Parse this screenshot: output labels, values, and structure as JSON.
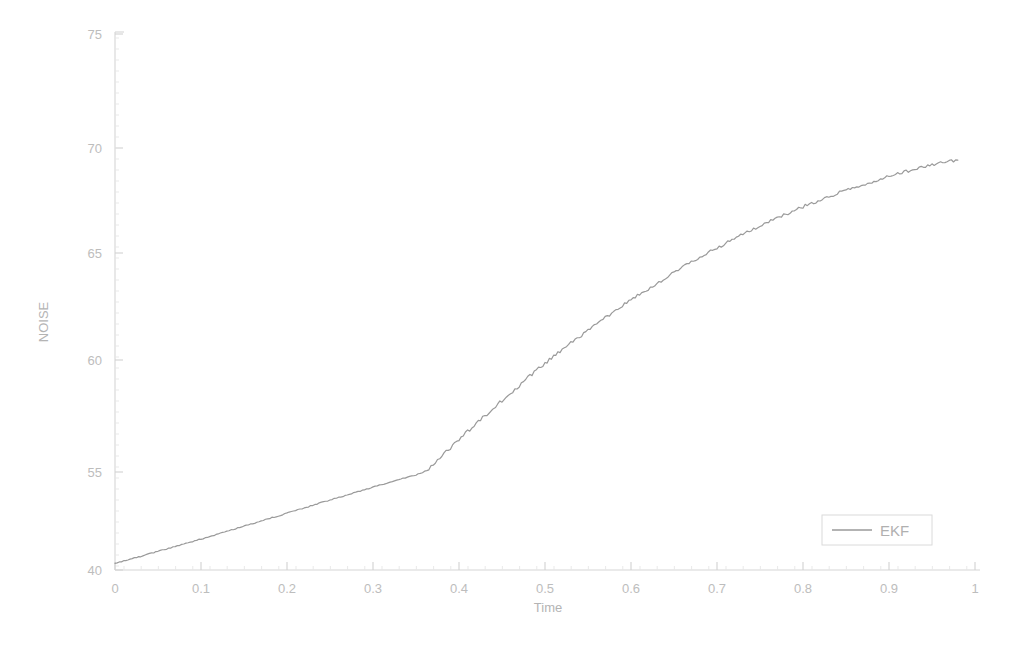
{
  "chart_data": {
    "type": "line",
    "title": "",
    "xlabel": "Time",
    "ylabel": "NOISE",
    "xlim": [
      0,
      1
    ],
    "ylim": [
      40,
      75
    ],
    "xticks": [
      "0",
      "0.1",
      "0.2",
      "0.3",
      "0.4",
      "0.5",
      "0.6",
      "0.7",
      "0.8",
      "0.9",
      "1"
    ],
    "xtick_values": [
      0,
      0.1,
      0.2,
      0.3,
      0.4,
      0.5,
      0.6,
      0.7,
      0.8,
      0.9,
      1
    ],
    "yticks": [
      "40",
      "55",
      "60",
      "65",
      "70",
      "75"
    ],
    "ytick_values": [
      40,
      55,
      60,
      65,
      70,
      75
    ],
    "grid": false,
    "legend": {
      "position": "lower-right",
      "entries": [
        "EKF"
      ]
    },
    "line_color": "#9a9a9a",
    "series": [
      {
        "name": "EKF",
        "color": "#9a9a9a",
        "x": [
          0.0,
          0.01,
          0.02,
          0.03,
          0.04,
          0.05,
          0.06,
          0.07,
          0.08,
          0.09,
          0.1,
          0.11,
          0.12,
          0.13,
          0.14,
          0.15,
          0.16,
          0.17,
          0.18,
          0.19,
          0.2,
          0.21,
          0.22,
          0.23,
          0.24,
          0.25,
          0.26,
          0.27,
          0.28,
          0.29,
          0.3,
          0.31,
          0.32,
          0.33,
          0.34,
          0.35,
          0.36,
          0.37,
          0.38,
          0.39,
          0.4,
          0.41,
          0.42,
          0.43,
          0.44,
          0.45,
          0.46,
          0.47,
          0.48,
          0.49,
          0.5,
          0.51,
          0.52,
          0.53,
          0.54,
          0.55,
          0.56,
          0.57,
          0.58,
          0.59,
          0.6,
          0.61,
          0.62,
          0.63,
          0.64,
          0.65,
          0.66,
          0.67,
          0.68,
          0.69,
          0.7,
          0.71,
          0.72,
          0.73,
          0.74,
          0.75,
          0.76,
          0.77,
          0.78,
          0.79,
          0.8,
          0.81,
          0.82,
          0.83,
          0.84,
          0.85,
          0.86,
          0.87,
          0.88,
          0.89,
          0.9,
          0.91,
          0.92,
          0.93,
          0.94,
          0.95,
          0.96,
          0.97,
          0.98
        ],
        "y": [
          41.0,
          41.35,
          41.72,
          42.1,
          42.48,
          42.85,
          43.22,
          43.6,
          43.98,
          44.36,
          44.74,
          45.12,
          45.52,
          45.92,
          46.32,
          46.7,
          47.1,
          47.5,
          47.92,
          48.3,
          48.7,
          49.1,
          49.5,
          49.92,
          50.32,
          50.7,
          51.1,
          51.48,
          51.88,
          52.28,
          52.68,
          53.05,
          53.44,
          53.82,
          54.2,
          54.58,
          54.96,
          55.34,
          55.72,
          56.08,
          56.44,
          56.8,
          57.15,
          57.5,
          57.84,
          58.18,
          58.52,
          58.86,
          59.2,
          59.52,
          59.84,
          60.16,
          60.48,
          60.78,
          61.08,
          61.38,
          61.66,
          61.96,
          62.24,
          62.52,
          62.8,
          63.06,
          63.32,
          63.58,
          63.84,
          64.08,
          64.32,
          64.56,
          64.8,
          65.02,
          65.24,
          65.46,
          65.68,
          65.88,
          66.08,
          66.28,
          66.48,
          66.66,
          66.84,
          67.02,
          67.2,
          67.36,
          67.52,
          67.68,
          67.84,
          67.98,
          68.12,
          68.26,
          68.4,
          68.52,
          68.64,
          68.76,
          68.88,
          68.98,
          69.08,
          69.18,
          69.28,
          69.36,
          69.44
        ]
      }
    ]
  },
  "legend": {
    "label": "EKF"
  },
  "axes": {
    "x_title": "Time",
    "y_title": "NOISE"
  }
}
